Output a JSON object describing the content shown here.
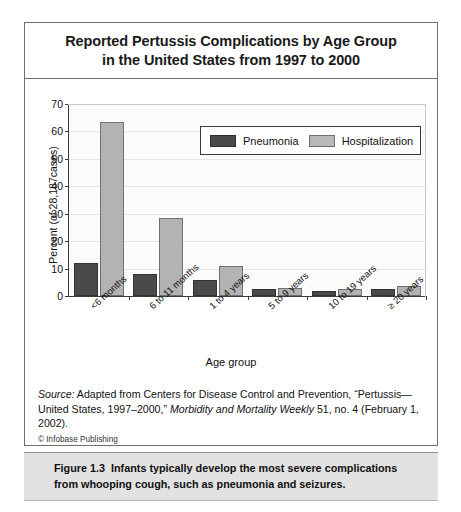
{
  "figure": {
    "title_line1": "Reported Pertussis Complications by Age Group",
    "title_line2": "in the United States from 1997 to 2000",
    "source_part1": "Source:",
    "source_part2": " Adapted from Centers for Disease Control and Prevention, “Pertussis—United States, 1997–2000,” ",
    "source_part3": "Morbidity and Mortality Weekly",
    "source_part4": " 51, no. 4 (February 1, 2002).",
    "copyright": "© Infobase Publishing",
    "caption_number": "Figure 1.3",
    "caption_body": "Infants typically develop the most severe complications from whooping cough, such as pneumonia and seizures."
  },
  "chart_data": {
    "type": "bar",
    "title": "Reported Pertussis Complications by Age Group in the United States from 1997 to 2000",
    "xlabel": "Age group",
    "ylabel": "Percent (of 28,187cases)",
    "ylim": [
      0,
      70
    ],
    "yticks": [
      0,
      10,
      20,
      30,
      40,
      50,
      60,
      70
    ],
    "grid": true,
    "legend_position": "top-right",
    "categories": [
      "<6 months",
      "6 to 11 months",
      "1 to 4 years",
      "5 to 9 years",
      "10 to 19 years",
      "≥ 20 years"
    ],
    "series": [
      {
        "name": "Pneumonia",
        "color": "#4a4a4a",
        "values": [
          12.0,
          8.0,
          5.8,
          2.6,
          2.0,
          2.6
        ]
      },
      {
        "name": "Hospitalization",
        "color": "#b3b3b3",
        "values": [
          63.5,
          28.5,
          10.8,
          3.0,
          2.4,
          3.8
        ]
      }
    ]
  }
}
